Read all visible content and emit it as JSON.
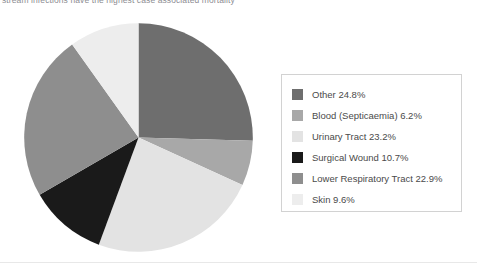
{
  "caption": {
    "text": "stream infections have the highest case associated mortality"
  },
  "legend": {
    "items": [
      {
        "label": "Other 24.8%",
        "color": "#6e6e6e"
      },
      {
        "label": "Blood (Septicaemia) 6.2%",
        "color": "#a8a8a8"
      },
      {
        "label": "Urinary Tract 23.2%",
        "color": "#e3e3e3"
      },
      {
        "label": "Surgical Wound 10.7%",
        "color": "#1a1a1a"
      },
      {
        "label": "Lower Respiratory Tract 22.9%",
        "color": "#8e8e8e"
      },
      {
        "label": "Skin 9.6%",
        "color": "#ededed"
      }
    ]
  },
  "chart_data": {
    "type": "pie",
    "title": "",
    "xlabel": "",
    "ylabel": "",
    "start_angle_deg": 0,
    "direction": "clockwise",
    "legend_position": "right",
    "grid": false,
    "categories": [
      "Other",
      "Blood (Septicaemia)",
      "Urinary Tract",
      "Surgical Wound",
      "Lower Respiratory Tract",
      "Skin"
    ],
    "values": [
      24.8,
      6.2,
      23.2,
      10.7,
      22.9,
      9.6
    ],
    "unit": "%",
    "colors": [
      "#6e6e6e",
      "#a8a8a8",
      "#e3e3e3",
      "#1a1a1a",
      "#8e8e8e",
      "#ededed"
    ],
    "slices": [
      {
        "label": "Other",
        "value": 24.8,
        "color": "#6e6e6e"
      },
      {
        "label": "Blood (Septicaemia)",
        "value": 6.2,
        "color": "#a8a8a8"
      },
      {
        "label": "Urinary Tract",
        "value": 23.2,
        "color": "#e3e3e3"
      },
      {
        "label": "Surgical Wound",
        "value": 10.7,
        "color": "#1a1a1a"
      },
      {
        "label": "Lower Respiratory Tract",
        "value": 22.9,
        "color": "#8e8e8e"
      },
      {
        "label": "Skin",
        "value": 9.6,
        "color": "#ededed"
      }
    ]
  }
}
